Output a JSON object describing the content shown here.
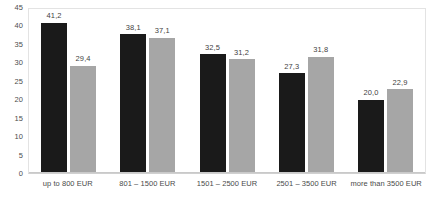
{
  "chart_data": {
    "type": "bar",
    "title": "",
    "subtitle": "",
    "xlabel": "",
    "ylabel": "",
    "categories": [
      "up to 800 EUR",
      "801 – 1500 EUR",
      "1501 – 2500 EUR",
      "2501 – 3500 EUR",
      "more than 3500 EUR"
    ],
    "series": [
      {
        "name": "series-1",
        "color": "#1a1a1a",
        "values": [
          41.2,
          38.1,
          32.5,
          27.3,
          20.0
        ],
        "labels": [
          "41,2",
          "38,1",
          "32,5",
          "27,3",
          "20,0"
        ]
      },
      {
        "name": "series-2",
        "color": "#a6a6a6",
        "values": [
          29.4,
          37.1,
          31.2,
          31.8,
          22.9
        ],
        "labels": [
          "29,4",
          "37,1",
          "31,2",
          "31,8",
          "22,9"
        ]
      }
    ],
    "ylim": [
      0,
      45
    ],
    "ytick_step": 5,
    "yticks": [
      45,
      40,
      35,
      30,
      25,
      20,
      15,
      10,
      5,
      0
    ],
    "ytick_labels": [
      "45",
      "40",
      "35",
      "30",
      "25",
      "20",
      "15",
      "10",
      "5",
      "0"
    ],
    "grid": false,
    "legend": false,
    "legend_position": "none",
    "decimal_separator": ","
  }
}
